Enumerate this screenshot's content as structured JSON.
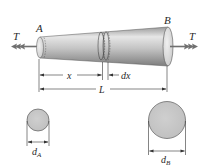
{
  "figure": {
    "type": "tapered-bar-torsion",
    "end_labels": {
      "left": "A",
      "right": "B"
    },
    "torque_labels": {
      "left": "T",
      "right": "T"
    },
    "dimensions": {
      "x": "x",
      "dx": "dx",
      "L": "L"
    },
    "cross_sections": {
      "left": {
        "label": "d",
        "subscript": "A"
      },
      "right": {
        "label": "d",
        "subscript": "B"
      }
    },
    "colors": {
      "bar_fill_light": "#d9d9d9",
      "bar_fill_dark": "#8c8c8c",
      "circle_fill": "#c8c8c8",
      "arrow": "#707070",
      "line": "#333333"
    }
  }
}
